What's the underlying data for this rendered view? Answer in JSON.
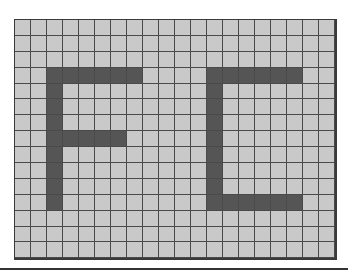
{
  "grid": {
    "columns": 20,
    "rows": 15,
    "colors": {
      "empty": "#c9c9c9",
      "filled": "#555555",
      "lines": "#4a4a4a"
    },
    "letters": [
      "F",
      "C"
    ],
    "filled_cells": [
      [
        3,
        2
      ],
      [
        3,
        3
      ],
      [
        3,
        4
      ],
      [
        3,
        5
      ],
      [
        3,
        6
      ],
      [
        3,
        7
      ],
      [
        4,
        2
      ],
      [
        5,
        2
      ],
      [
        6,
        2
      ],
      [
        7,
        2
      ],
      [
        8,
        2
      ],
      [
        9,
        2
      ],
      [
        10,
        2
      ],
      [
        11,
        2
      ],
      [
        7,
        3
      ],
      [
        7,
        4
      ],
      [
        7,
        5
      ],
      [
        7,
        6
      ],
      [
        3,
        12
      ],
      [
        3,
        13
      ],
      [
        3,
        14
      ],
      [
        3,
        15
      ],
      [
        3,
        16
      ],
      [
        3,
        17
      ],
      [
        4,
        12
      ],
      [
        5,
        12
      ],
      [
        6,
        12
      ],
      [
        7,
        12
      ],
      [
        8,
        12
      ],
      [
        9,
        12
      ],
      [
        10,
        12
      ],
      [
        11,
        12
      ],
      [
        11,
        13
      ],
      [
        11,
        14
      ],
      [
        11,
        15
      ],
      [
        11,
        16
      ],
      [
        11,
        17
      ]
    ]
  }
}
